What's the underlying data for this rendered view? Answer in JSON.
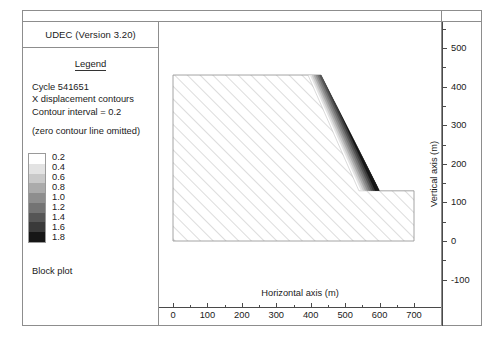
{
  "window": {
    "app_title": "UDEC (Version 3.20)"
  },
  "legend": {
    "heading": "Legend",
    "cycle": "Cycle 541651",
    "quantity": "X displacement contours",
    "interval": "Contour interval = 0.2",
    "note": "(zero contour line omitted)",
    "plot_type": "Block plot",
    "scale": {
      "labels": [
        "0.2",
        "0.4",
        "0.6",
        "0.8",
        "1.0",
        "1.2",
        "1.4",
        "1.6",
        "1.8"
      ],
      "colors": [
        "#ffffff",
        "#e3e3e3",
        "#c9c9c9",
        "#ababab",
        "#8e8e8e",
        "#747474",
        "#565656",
        "#3a3a3a",
        "#161616"
      ]
    }
  },
  "chart_data": {
    "type": "contour",
    "title": "",
    "xlabel": "Horizontal axis (m)",
    "ylabel": "Vertical axis (m)",
    "xlim": [
      0,
      700
    ],
    "ylim": [
      -100,
      550
    ],
    "xticks": [
      0,
      100,
      200,
      300,
      400,
      500,
      600,
      700
    ],
    "xtick_labels": [
      "0",
      "100",
      "200",
      "300",
      "400",
      "500",
      "600",
      "700"
    ],
    "xminor_step": 50,
    "yticks": [
      -100,
      0,
      100,
      200,
      300,
      400,
      500
    ],
    "ytick_labels": [
      "-100",
      "0",
      "100",
      "200",
      "300",
      "400",
      "500"
    ],
    "yminor_step": 50,
    "grid": false,
    "legend_position": "left-panel",
    "contour_levels": [
      0.2,
      0.4,
      0.6,
      0.8,
      1.0,
      1.2,
      1.4,
      1.6,
      1.8
    ],
    "contour_interval": 0.2,
    "block_outline_m": [
      [
        0,
        430
      ],
      [
        430,
        430
      ],
      [
        600,
        130
      ],
      [
        700,
        130
      ],
      [
        700,
        0
      ],
      [
        0,
        0
      ]
    ],
    "displacement_wedge_m": [
      [
        392,
        430
      ],
      [
        462,
        430
      ],
      [
        600,
        130
      ],
      [
        540,
        130
      ]
    ]
  }
}
